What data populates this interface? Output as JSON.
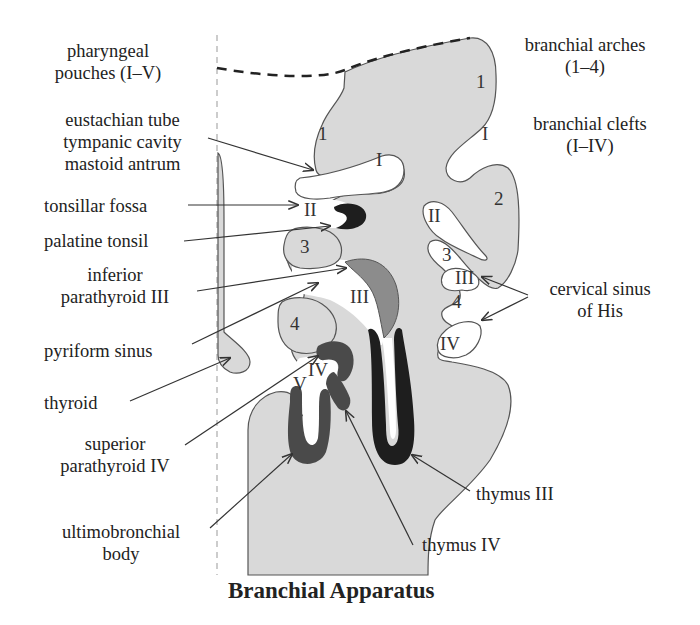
{
  "title": "Branchial Apparatus",
  "legend_labels": {
    "pharyngeal_pouches": [
      "pharyngeal",
      "pouches (I–V)"
    ],
    "branchial_arches": [
      "branchial arches",
      "(1–4)"
    ],
    "branchial_clefts": [
      "branchial clefts",
      "(I–IV)"
    ],
    "cervical_sinus": [
      "cervical sinus",
      "of His"
    ]
  },
  "derivative_labels": {
    "eustachian": [
      "eustachian tube",
      "tympanic cavity",
      "mastoid antrum"
    ],
    "tonsillar_fossa": "tonsillar fossa",
    "palatine_tonsil": "palatine tonsil",
    "inferior_parathyroid": [
      "inferior",
      "parathyroid III"
    ],
    "pyriform_sinus": "pyriform sinus",
    "thyroid": "thyroid",
    "superior_parathyroid": [
      "superior",
      "parathyroid IV"
    ],
    "ultimobronchial": [
      "ultimobronchial",
      "body"
    ],
    "thymus_iii": "thymus III",
    "thymus_iv": "thymus IV"
  },
  "structure_marks": {
    "arch_1_top": "1",
    "arch_1_left": "1",
    "arch_2": "2",
    "arch_3_left": "3",
    "arch_3_right": "3",
    "arch_4_left": "4",
    "arch_4_right": "4",
    "pouch_I": "I",
    "pouch_II": "II",
    "pouch_III": "III",
    "pouch_IV": "IV",
    "pouch_V": "V",
    "cleft_I": "I",
    "cleft_II": "II",
    "cleft_III": "III",
    "cleft_IV": "IV"
  },
  "colors": {
    "tissue": "#d9d9d9",
    "outline": "#555555",
    "dark": "#1e1e1e",
    "mid_dark": "#4a4a4a",
    "mid": "#8c8c8c"
  }
}
